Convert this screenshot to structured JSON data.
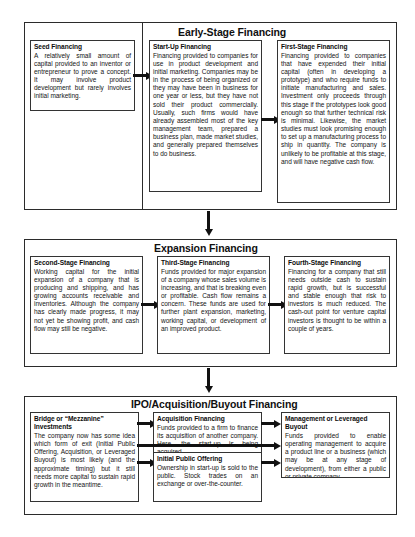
{
  "diagram": {
    "type": "flowchart"
  },
  "stages": [
    {
      "id": "early-stage",
      "label": "Early-Stage Financing",
      "cards": [
        {
          "id": "seed-financing",
          "title": "Seed Financing",
          "body": "A relatively small amount of capital provided to an inventor or entrepreneur to prove a concept. It may involve product development but rarely involves initial marketing."
        },
        {
          "id": "start-up-financing",
          "title": "Start-Up Financing",
          "body": "Financing provided to companies for use in product development and initial marketing. Companies may be in the process of being organized or they may have been in business for one year or less, but they have not sold their product commercially. Usually, such firms would have already assembled most of the key management team, prepared a business plan, made market studies, and generally prepared themselves to do business."
        },
        {
          "id": "first-stage-financing",
          "title": "First-Stage Financing",
          "body": "Financing provided to companies that have expended their initial capital (often in developing a prototype) and who require funds to initiate manufacturing and sales. Investment only proceeds through this stage if the prototypes look good enough so that further technical risk is minimal. Likewise, the market studies must look promising enough to set up a manufacturing process to ship in quantity. The company is unlikely to be profitable at this stage, and will have negative cash flow."
        }
      ]
    },
    {
      "id": "expansion",
      "label": "Expansion Financing",
      "cards": [
        {
          "id": "second-stage-financing",
          "title": "Second-Stage Financing",
          "body": "Working capital for the initial expansion of a company that is producing and shipping, and has growing accounts receivable and inventories. Although the company has clearly made progress, it may not yet be showing profit, and cash flow may still be negative."
        },
        {
          "id": "third-stage-financing",
          "title": "Third-Stage Financing",
          "body": "Funds provided for major expansion of a company whose sales volume is increasing, and that is breaking even or profitable. Cash flow remains a concern. These funds are used for further plant expansion, marketing, working capital, or development of an improved product."
        },
        {
          "id": "fourth-stage-financing",
          "title": "Fourth-Stage Financing",
          "body": "Financing for a company that still needs outside cash to sustain rapid growth, but is successful and stable enough that risk to investors is much reduced. The cash-out point for venture capital investors is thought to be within a couple of years."
        }
      ]
    },
    {
      "id": "ipo-acquisition-buyout",
      "label": "IPO/Acquisition/Buyout Financing",
      "cards": [
        {
          "id": "bridge-mezzanine-investments",
          "title": "Bridge or “Mezzanine” Investments",
          "body": "The company now has some idea which form of exit (Initial Public Offering, Acquisition, or Leveraged Buyout) is most likely (and the approximate timing) but it still needs more capital to sustain rapid growth in the meantime."
        },
        {
          "id": "acquisition-financing",
          "title": "Acquisition Financing",
          "body": "Funds provided to a firm to finance its acquisition of another company. Here, the start-up is being acquired."
        },
        {
          "id": "initial-public-offering",
          "title": "Initial Public Offering",
          "body": "Ownership in start-up is sold to the public. Stock trades on an exchange or over-the-counter."
        },
        {
          "id": "management-leveraged-buyout",
          "title": "Management or Leveraged Buyout",
          "body": "Funds provided to enable operating management to acquire a product line or a business (which may be at any stage of development), from either a public or private company."
        }
      ]
    }
  ],
  "colors": {
    "border": "#2b2b2b",
    "card_border": "#333333",
    "text": "#121212",
    "background": "#ffffff",
    "connector": "#111111"
  }
}
